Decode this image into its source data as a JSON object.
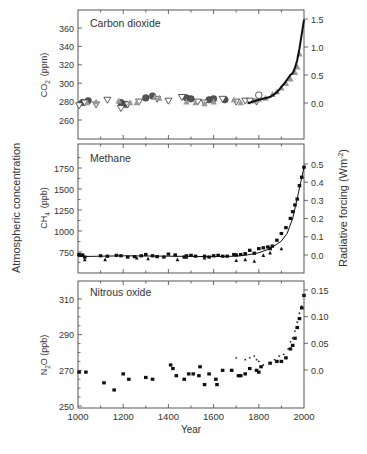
{
  "figure": {
    "left_axis_label": "Atmospheric concentration",
    "right_axis_label": "Radiative forcing  (Wm",
    "right_axis_label_sup": "-2",
    "right_axis_label_close": ")",
    "x_label": "Year",
    "x_ticks": [
      1000,
      1200,
      1400,
      1600,
      1800,
      2000
    ]
  },
  "chart_data": [
    {
      "type": "scatter",
      "title": "Carbon dioxide",
      "ylabel": "CO2 (ppm)",
      "ylabel_main": "CO",
      "ylabel_sub": "2",
      "ylabel_unit": "(ppm)",
      "xlabel": "Year",
      "xlim": [
        1000,
        2000
      ],
      "ylim": [
        240,
        375
      ],
      "y_ticks": [
        260,
        280,
        300,
        320,
        340,
        360
      ],
      "y2_label": "Radiative forcing (Wm-2)",
      "y2_ticks": [
        "0.0",
        "0.5",
        "1.0",
        "1.5"
      ],
      "y2_tick_values": [
        0.0,
        0.5,
        1.0,
        1.5
      ],
      "grid": false,
      "series": [
        {
          "name": "ice core (circles)",
          "marker": "circle-filled-dark",
          "x": [
            1020,
            1045,
            1190,
            1210,
            1300,
            1330,
            1480,
            1500,
            1580,
            1600,
            1650
          ],
          "y": [
            279,
            281,
            279,
            277,
            284,
            286,
            284,
            283,
            282,
            283,
            282
          ]
        },
        {
          "name": "ice core (open triangles)",
          "marker": "triangle-down-open",
          "x": [
            1005,
            1030,
            1080,
            1130,
            1190,
            1220,
            1270,
            1350,
            1400,
            1460,
            1530,
            1560,
            1640,
            1700,
            1740,
            1760,
            1790
          ],
          "y": [
            276,
            279,
            277,
            282,
            273,
            277,
            280,
            283,
            281,
            285,
            280,
            279,
            283,
            280,
            281,
            281,
            280
          ]
        },
        {
          "name": "ice core (grey triangles)",
          "marker": "triangle-up-grey",
          "x": [
            1040,
            1080,
            1180,
            1230,
            1260,
            1340,
            1360,
            1480,
            1520,
            1560,
            1600,
            1690,
            1720,
            1780,
            1800,
            1830,
            1860,
            1880,
            1900,
            1920,
            1940,
            1960,
            1970,
            1980
          ],
          "y": [
            279,
            280,
            281,
            279,
            279,
            285,
            284,
            280,
            279,
            278,
            280,
            282,
            279,
            281,
            283,
            284,
            288,
            291,
            295,
            300,
            305,
            312,
            318,
            332
          ]
        },
        {
          "name": "instrumental / fit",
          "marker": "line",
          "x": [
            1750,
            1800,
            1850,
            1880,
            1900,
            1920,
            1940,
            1950,
            1960,
            1970,
            1980,
            1990,
            2000
          ],
          "y": [
            278,
            282,
            285,
            290,
            296,
            302,
            309,
            311,
            317,
            325,
            338,
            353,
            369
          ]
        },
        {
          "name": "open circle",
          "marker": "circle-open",
          "x": [
            1800
          ],
          "y": [
            287
          ]
        }
      ]
    },
    {
      "type": "scatter",
      "title": "Methane",
      "ylabel": "CH4 (ppb)",
      "ylabel_main": "CH",
      "ylabel_sub": "4",
      "ylabel_unit": "(ppb)",
      "xlabel": "Year",
      "xlim": [
        1000,
        2000
      ],
      "ylim": [
        550,
        2000
      ],
      "y_ticks": [
        750,
        1000,
        1250,
        1500,
        1750
      ],
      "y2_label": "Radiative forcing (Wm-2)",
      "y2_ticks": [
        "0.0",
        "0.1",
        "0.2",
        "0.3",
        "0.4",
        "0.5"
      ],
      "y2_tick_values": [
        0.0,
        0.1,
        0.2,
        0.3,
        0.4,
        0.5
      ],
      "grid": false,
      "series": [
        {
          "name": "ice core (squares)",
          "marker": "square",
          "x": [
            1005,
            1020,
            1030,
            1100,
            1130,
            1170,
            1190,
            1220,
            1250,
            1280,
            1300,
            1330,
            1350,
            1380,
            1400,
            1430,
            1470,
            1480,
            1500,
            1520,
            1560,
            1580,
            1600,
            1620,
            1640,
            1660,
            1690,
            1700,
            1720,
            1740,
            1760,
            1780,
            1800,
            1820,
            1840,
            1850,
            1860,
            1880,
            1900,
            1920,
            1940,
            1950,
            1960,
            1970,
            1980,
            1990,
            2000
          ],
          "y": [
            720,
            715,
            690,
            705,
            700,
            710,
            705,
            690,
            695,
            705,
            720,
            705,
            695,
            690,
            725,
            715,
            690,
            705,
            710,
            700,
            700,
            690,
            705,
            710,
            700,
            700,
            720,
            715,
            720,
            730,
            770,
            735,
            790,
            800,
            810,
            790,
            820,
            890,
            970,
            1040,
            1150,
            1230,
            1310,
            1380,
            1540,
            1640,
            1760
          ]
        },
        {
          "name": "ice core (triangles)",
          "marker": "triangle",
          "x": [
            1030,
            1120,
            1260,
            1310,
            1440,
            1480,
            1560,
            1700,
            1740,
            1780,
            1820,
            1850,
            1900
          ],
          "y": [
            660,
            660,
            680,
            670,
            660,
            690,
            680,
            650,
            660,
            640,
            710,
            740,
            790
          ]
        },
        {
          "name": "fit",
          "marker": "line",
          "x": [
            1000,
            1200,
            1400,
            1600,
            1700,
            1750,
            1800,
            1850,
            1900,
            1925,
            1950,
            1975,
            2000
          ],
          "y": [
            695,
            705,
            700,
            695,
            700,
            715,
            740,
            790,
            880,
            970,
            1150,
            1450,
            1760
          ]
        }
      ]
    },
    {
      "type": "scatter",
      "title": "Nitrous oxide",
      "ylabel": "N2O (ppb)",
      "ylabel_main": "N",
      "ylabel_sub": "2",
      "ylabel_unit": "O  (ppb)",
      "xlabel": "Year",
      "xlim": [
        1000,
        2000
      ],
      "ylim": [
        250,
        315
      ],
      "y_ticks": [
        250,
        270,
        290,
        310
      ],
      "y2_label": "Radiative forcing (Wm-2)",
      "y2_ticks": [
        "0.0",
        "0.05",
        "0.10",
        "0.15"
      ],
      "y2_tick_values": [
        0.0,
        0.05,
        0.1,
        0.15
      ],
      "grid": false,
      "series": [
        {
          "name": "ice core (squares)",
          "marker": "square",
          "x": [
            1005,
            1035,
            1115,
            1160,
            1200,
            1225,
            1300,
            1330,
            1410,
            1420,
            1435,
            1470,
            1490,
            1510,
            1535,
            1540,
            1560,
            1580,
            1610,
            1615,
            1640,
            1680,
            1710,
            1720,
            1740,
            1760,
            1790,
            1800,
            1810,
            1850,
            1880,
            1900,
            1920,
            1940,
            1950,
            1960,
            1970,
            1980,
            1990,
            2000
          ],
          "y": [
            269,
            269,
            263,
            259,
            268,
            265,
            266,
            265,
            273,
            271,
            267,
            265,
            268,
            268,
            267,
            272,
            262,
            268,
            265,
            262,
            270,
            270,
            267,
            267,
            268,
            271,
            270,
            269,
            272,
            274,
            275,
            275,
            277,
            282,
            284,
            288,
            294,
            299,
            305,
            312
          ]
        },
        {
          "name": "firn / other (dots)",
          "marker": "small-dot",
          "x": [
            1700,
            1740,
            1760,
            1780,
            1790,
            1800,
            1820,
            1850,
            1870,
            1890,
            1910,
            1930,
            1940,
            1950,
            1960,
            1970,
            1980,
            1990,
            2000
          ],
          "y": [
            277,
            276,
            277,
            278,
            276,
            275,
            273,
            274,
            276,
            278,
            279,
            282,
            286,
            288,
            292,
            297,
            302,
            306,
            312
          ]
        }
      ]
    }
  ]
}
